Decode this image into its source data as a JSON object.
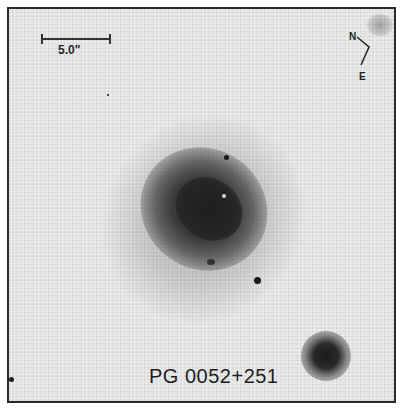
{
  "figure": {
    "object_name": "PG 0052+251",
    "scale_bar": {
      "label": "5.0\""
    },
    "compass": {
      "north_label": "N",
      "east_label": "E"
    },
    "colors": {
      "background": "#ececec",
      "frame": "#2a2a2a",
      "galaxy_core": "#1e1e1e"
    }
  }
}
